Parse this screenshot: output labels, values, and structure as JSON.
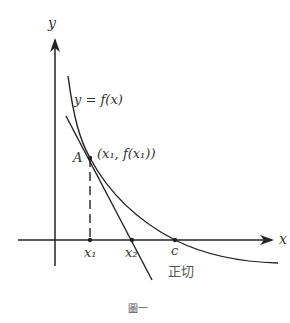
{
  "diagram": {
    "type": "newton-method-tangent",
    "caption": "圖一",
    "labels": {
      "y_axis": "y",
      "x_axis": "x",
      "function": "y = f(x)",
      "point_name": "A",
      "point_coords": "(x₁, f(x₁))",
      "x1": "x₁",
      "x2": "x₂",
      "root": "c",
      "tangent": "正切"
    },
    "colors": {
      "stroke": "#222222",
      "text": "#333333",
      "background": "#ffffff"
    }
  }
}
